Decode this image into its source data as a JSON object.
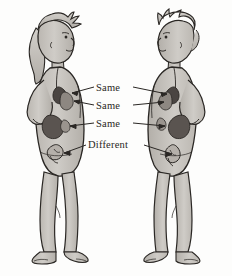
{
  "illustration": {
    "title": "Comparison of internal anatomy between two human figures",
    "background_color": "#fdfdfc",
    "ink_color": "#2a2724",
    "skin_fill": "#c9c6c1",
    "skin_shadow": "#ada9a3",
    "organ_dark": "#4a4542",
    "organ_mid": "#6e6865",
    "organ_light": "#8d8781"
  },
  "labels": {
    "row_1": "Same",
    "row_2": "Same",
    "row_3": "Same",
    "row_4": "Different"
  },
  "figures": {
    "left": {
      "name": "left-figure",
      "description": "Standing figure facing right, longer hair with hanging lock, hand on hip",
      "hair": "long",
      "facing": "right"
    },
    "right": {
      "name": "right-figure",
      "description": "Standing figure facing left, shorter tousled hair, hand on hip",
      "hair": "short",
      "facing": "left"
    }
  },
  "annotations": [
    {
      "label": "Same",
      "target": "lungs",
      "arrows": [
        "left",
        "right"
      ]
    },
    {
      "label": "Same",
      "target": "heart",
      "arrows": [
        "left",
        "right"
      ]
    },
    {
      "label": "Same",
      "target": "liver-stomach",
      "arrows": [
        "left",
        "right"
      ]
    },
    {
      "label": "Different",
      "target": "reproductive-organs",
      "arrows": [
        "left",
        "right"
      ]
    }
  ]
}
